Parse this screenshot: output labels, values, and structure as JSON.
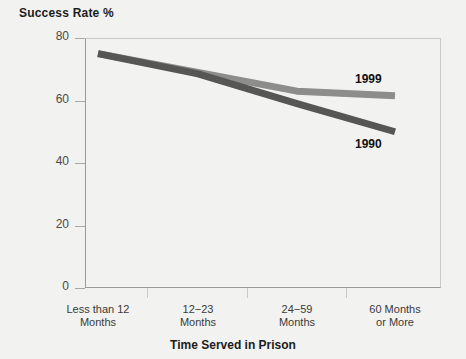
{
  "chart_data": {
    "type": "line",
    "title": "",
    "ylabel": "Success Rate %",
    "xlabel": "Time Served in Prison",
    "categories": [
      "Less than 12 Months",
      "12−23 Months",
      "24−59 Months",
      "60 Months or More"
    ],
    "category_lines": [
      [
        "Less than 12",
        "Months"
      ],
      [
        "12−23",
        "Months"
      ],
      [
        "24−59",
        "Months"
      ],
      [
        "60 Months",
        "or More"
      ]
    ],
    "ylim": [
      0,
      80
    ],
    "yticks": [
      0,
      20,
      40,
      60,
      80
    ],
    "ytick_labels": [
      "0",
      "20",
      "40",
      "60",
      "80"
    ],
    "grid": false,
    "legend_position": "line-end-labels",
    "series": [
      {
        "name": "1999",
        "color": "#8d8d8b",
        "values": [
          75,
          69,
          63,
          61.5
        ],
        "label": "1999"
      },
      {
        "name": "1990",
        "color": "#565654",
        "values": [
          75,
          68.5,
          59,
          50
        ],
        "label": "1990"
      }
    ]
  },
  "axis": {
    "y_title": "Success Rate %",
    "x_title": "Time Served in Prison"
  },
  "colors": {
    "background": "#f2f2f0",
    "frame": "#9a9a98",
    "tick_text": "#4a4a48",
    "series_1999": "#8d8d8b",
    "series_1990": "#565654"
  }
}
